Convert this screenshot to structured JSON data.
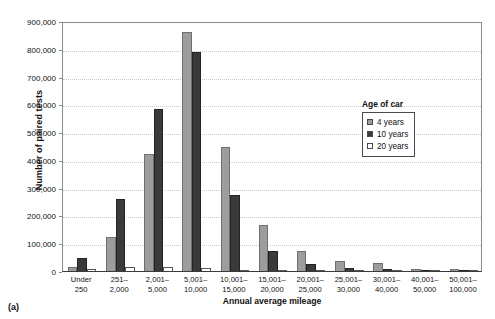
{
  "chart_data": {
    "type": "bar",
    "title": "",
    "xlabel": "Annual average mileage",
    "ylabel": "Number of paired tests",
    "ylim": [
      0,
      900000
    ],
    "yticks": [
      0,
      100000,
      200000,
      300000,
      400000,
      500000,
      600000,
      700000,
      800000,
      900000
    ],
    "ytick_labels": [
      "0",
      "100,000",
      "200,000",
      "300,000",
      "400,000",
      "500,000",
      "600,000",
      "700,000",
      "800,000",
      "900,000"
    ],
    "grid": true,
    "legend_position": "right-inside",
    "legend_title": "Age of car",
    "categories": [
      "Under 250",
      "251– 2,000",
      "2,001– 5,000",
      "5,001– 10,000",
      "10,001– 15,000",
      "15,001– 20,000",
      "20,001– 25,000",
      "25,001– 30,000",
      "30,001– 40,000",
      "40,001– 50,000",
      "50,001– 100,000"
    ],
    "category_lines": [
      [
        "Under",
        "250"
      ],
      [
        "251–",
        "2,000"
      ],
      [
        "2,001–",
        "5,000"
      ],
      [
        "5,001–",
        "10,000"
      ],
      [
        "10,001–",
        "15,000"
      ],
      [
        "15,001–",
        "20,000"
      ],
      [
        "20,001–",
        "25,000"
      ],
      [
        "25,001–",
        "30,000"
      ],
      [
        "30,001–",
        "40,000"
      ],
      [
        "40,001–",
        "50,000"
      ],
      [
        "50,001–",
        "100,000"
      ]
    ],
    "series": [
      {
        "name": "4 years",
        "color": "#9d9d9d",
        "values": [
          15000,
          123000,
          421000,
          860000,
          446000,
          167000,
          72000,
          37000,
          30000,
          9000,
          7000
        ]
      },
      {
        "name": "10 years",
        "color": "#3a3a3a",
        "values": [
          47000,
          259000,
          583000,
          790000,
          273000,
          71000,
          24000,
          10000,
          7000,
          2000,
          1500
        ]
      },
      {
        "name": "20 years",
        "color": "#ffffff",
        "values": [
          9000,
          14000,
          14000,
          11000,
          3000,
          1500,
          1000,
          700,
          500,
          300,
          200
        ]
      }
    ]
  },
  "caption": "(a)"
}
